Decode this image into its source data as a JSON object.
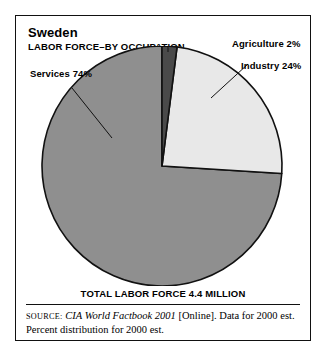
{
  "figure": {
    "title": "Sweden",
    "subtitle": "LABOR FORCE–BY OCCUPATION",
    "total_caption": "TOTAL LABOR FORCE 4.4 MILLION"
  },
  "callouts": {
    "services": "Services 74%",
    "agriculture": "Agriculture 2%",
    "industry": "Industry 24%"
  },
  "source": {
    "label": "Source:",
    "work": "CIA World Factbook 2001",
    "rest": " [Online]. Data for 2000 est. Percent distribution for 2000 est."
  },
  "colors": {
    "services": "#8f8f8f",
    "industry": "#e8e8e8",
    "agriculture": "#4a4a4a",
    "outline": "#111111",
    "frame": "#111111",
    "background": "#ffffff"
  },
  "chart_data": {
    "type": "pie",
    "subtitle": "LABOR FORCE–BY OCCUPATION",
    "unit": "percent of labor force",
    "total_label": "TOTAL LABOR FORCE 4.4 MILLION",
    "total_value": 4.4,
    "total_unit": "million persons",
    "categories": [
      "Agriculture",
      "Industry",
      "Services"
    ],
    "values": [
      2,
      24,
      74
    ],
    "labels": [
      "Agriculture 2%",
      "Industry 24%",
      "Services 74%"
    ],
    "colors": [
      "#4a4a4a",
      "#e8e8e8",
      "#8f8f8f"
    ],
    "start_angle_deg": 0,
    "direction": "clockwise",
    "legend": "callout-labels",
    "grid": false
  }
}
